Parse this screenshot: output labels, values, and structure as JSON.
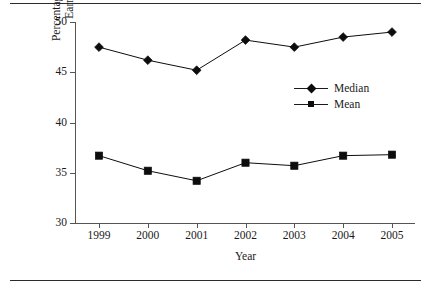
{
  "chart_data": {
    "type": "line",
    "title": "",
    "xlabel": "Year",
    "ylabel": "Percentage of Gross Hourly Earnings Measure",
    "ylabel_lines": [
      "Percentage of Gross Hourly",
      "Earnings Measure"
    ],
    "categories": [
      "1999",
      "2000",
      "2001",
      "2002",
      "2003",
      "2004",
      "2005"
    ],
    "x": [
      1999,
      2000,
      2001,
      2002,
      2003,
      2004,
      2005
    ],
    "xlim": [
      1998.5,
      2005.5
    ],
    "ylim": [
      30,
      50
    ],
    "yticks": [
      30,
      35,
      40,
      45,
      50
    ],
    "ytick_labels": [
      "30",
      "35",
      "40",
      "45",
      "50"
    ],
    "xtick_labels": [
      "1999",
      "2000",
      "2001",
      "2002",
      "2003",
      "2004",
      "2005"
    ],
    "grid": false,
    "legend_position": "upper-right-inside",
    "series": [
      {
        "name": "Median",
        "marker": "diamond",
        "color": "#0d0d0d",
        "values": [
          47.5,
          46.2,
          45.2,
          48.2,
          47.5,
          48.5,
          49.0
        ]
      },
      {
        "name": "Mean",
        "marker": "square",
        "color": "#0d0d0d",
        "values": [
          36.7,
          35.2,
          34.2,
          36.0,
          35.7,
          36.7,
          36.8
        ]
      }
    ]
  },
  "legend": {
    "items": [
      {
        "label": "Median",
        "marker": "diamond"
      },
      {
        "label": "Mean",
        "marker": "square"
      }
    ]
  },
  "colors": {
    "ink": "#1a1a1a",
    "axis": "#555555",
    "rule": "#2b2b2b",
    "marker": "#0d0d0d",
    "background": "#ffffff"
  }
}
